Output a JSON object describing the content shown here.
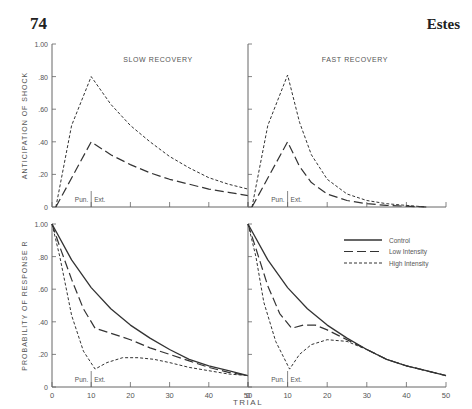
{
  "page": {
    "number": "74",
    "running_head": "Estes"
  },
  "chart_data": {
    "type": "line",
    "layout": "2x2 panels, shared x axis 'TRIAL'",
    "xlabel": "TRIAL",
    "x_ticks": [
      0,
      10,
      20,
      30,
      40,
      50
    ],
    "phase_labels": {
      "punishment": "Pun.",
      "extinction": "Ext.",
      "boundary_trial": 10
    },
    "legend": [
      {
        "name": "Control",
        "style": "solid"
      },
      {
        "name": "Low Intensity",
        "style": "long-dash"
      },
      {
        "name": "High Intensity",
        "style": "short-dash"
      }
    ],
    "panels": [
      {
        "id": "top-left",
        "title": "SLOW RECOVERY",
        "ylabel": "ANTICIPATION OF SHOCK",
        "ylim": [
          0,
          1.0
        ],
        "y_ticks": [
          "0",
          ".20",
          ".40",
          ".60",
          ".80",
          "1.00"
        ],
        "show_y_labels": true,
        "series": [
          {
            "name": "Low Intensity",
            "x": [
              1,
              10,
              15,
              20,
              25,
              30,
              35,
              40,
              45,
              50
            ],
            "y": [
              0.0,
              0.4,
              0.32,
              0.26,
              0.21,
              0.17,
              0.14,
              0.11,
              0.09,
              0.07
            ]
          },
          {
            "name": "High Intensity",
            "x": [
              1,
              5,
              10,
              15,
              20,
              25,
              30,
              35,
              40,
              45,
              50
            ],
            "y": [
              0.0,
              0.5,
              0.8,
              0.63,
              0.5,
              0.4,
              0.31,
              0.24,
              0.18,
              0.14,
              0.11
            ]
          }
        ]
      },
      {
        "id": "top-right",
        "title": "FAST RECOVERY",
        "ylabel": "",
        "ylim": [
          0,
          1.0
        ],
        "y_ticks": [
          "0",
          ".20",
          ".40",
          ".60",
          ".80",
          "1.00"
        ],
        "show_y_labels": false,
        "series": [
          {
            "name": "Low Intensity",
            "x": [
              1,
              10,
              13,
              16,
              20,
              25,
              30,
              35,
              40,
              45
            ],
            "y": [
              0.0,
              0.4,
              0.25,
              0.15,
              0.08,
              0.04,
              0.02,
              0.01,
              0.005,
              0.0
            ]
          },
          {
            "name": "High Intensity",
            "x": [
              1,
              5,
              10,
              13,
              16,
              20,
              25,
              30,
              35,
              40,
              45
            ],
            "y": [
              0.0,
              0.5,
              0.81,
              0.52,
              0.32,
              0.17,
              0.08,
              0.04,
              0.02,
              0.01,
              0.0
            ]
          }
        ]
      },
      {
        "id": "bottom-left",
        "title": "",
        "ylabel": "PROBABILITY OF RESPONSE R",
        "ylim": [
          0,
          1.0
        ],
        "y_ticks": [
          "0",
          ".20",
          ".40",
          ".60",
          ".80",
          "1.00"
        ],
        "show_y_labels": true,
        "series": [
          {
            "name": "Control",
            "x": [
              0,
              5,
              10,
              15,
              20,
              25,
              30,
              35,
              40,
              45,
              50
            ],
            "y": [
              1.0,
              0.78,
              0.61,
              0.48,
              0.38,
              0.3,
              0.23,
              0.17,
              0.13,
              0.1,
              0.07
            ]
          },
          {
            "name": "Low Intensity",
            "x": [
              0,
              2,
              5,
              8,
              11,
              15,
              20,
              25,
              30,
              35,
              40,
              45,
              50
            ],
            "y": [
              1.0,
              0.86,
              0.66,
              0.48,
              0.36,
              0.33,
              0.29,
              0.24,
              0.2,
              0.16,
              0.12,
              0.09,
              0.07
            ]
          },
          {
            "name": "High Intensity",
            "x": [
              0,
              2,
              5,
              8,
              11,
              14,
              18,
              22,
              26,
              30,
              35,
              40,
              45,
              50
            ],
            "y": [
              1.0,
              0.8,
              0.44,
              0.22,
              0.11,
              0.15,
              0.18,
              0.18,
              0.17,
              0.15,
              0.12,
              0.1,
              0.08,
              0.07
            ]
          }
        ]
      },
      {
        "id": "bottom-right",
        "title": "",
        "ylabel": "",
        "ylim": [
          0,
          1.0
        ],
        "y_ticks": [
          "0",
          ".20",
          ".40",
          ".60",
          ".80",
          "1.00"
        ],
        "show_y_labels": false,
        "series": [
          {
            "name": "Control",
            "x": [
              0,
              5,
              10,
              15,
              20,
              25,
              30,
              35,
              40,
              45,
              50
            ],
            "y": [
              1.0,
              0.78,
              0.61,
              0.48,
              0.38,
              0.3,
              0.23,
              0.17,
              0.13,
              0.1,
              0.07
            ]
          },
          {
            "name": "Low Intensity",
            "x": [
              0,
              2,
              5,
              8,
              11,
              14,
              17,
              20,
              25,
              30,
              35,
              40,
              45,
              50
            ],
            "y": [
              1.0,
              0.85,
              0.62,
              0.45,
              0.36,
              0.38,
              0.38,
              0.35,
              0.29,
              0.23,
              0.17,
              0.13,
              0.1,
              0.07
            ]
          },
          {
            "name": "High Intensity",
            "x": [
              0,
              2,
              4,
              7,
              10.5,
              13,
              16,
              20,
              25,
              30,
              35,
              40,
              45,
              50
            ],
            "y": [
              1.0,
              0.8,
              0.52,
              0.28,
              0.11,
              0.2,
              0.26,
              0.29,
              0.28,
              0.23,
              0.17,
              0.13,
              0.1,
              0.07
            ]
          }
        ]
      }
    ]
  }
}
